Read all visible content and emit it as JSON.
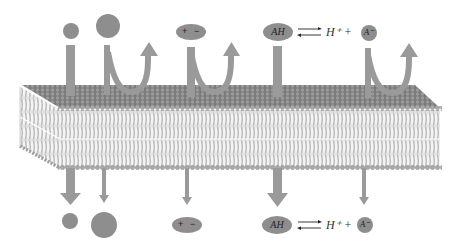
{
  "figure": {
    "colors": {
      "background": "#ffffff",
      "molecule": "#8c8c8c",
      "arrow": "#9a9a9a",
      "membrane_head": "#8a8a8a",
      "membrane_tail": "#b0b0b0",
      "text": "#333333"
    }
  },
  "top_row": {
    "small_molecule": {
      "label": ""
    },
    "large_molecule": {
      "label": ""
    },
    "charged_molecule": {
      "plus": "+",
      "minus": "−"
    },
    "weak_acid": {
      "oval": "AH",
      "equilibrium": "⇄",
      "proton": "H⁺ +",
      "anion": "A⁻"
    }
  },
  "bottom_row": {
    "small_molecule": {
      "label": ""
    },
    "large_molecule": {
      "label": ""
    },
    "charged_molecule": {
      "plus": "+",
      "minus": "−"
    },
    "weak_acid": {
      "oval": "AH",
      "equilibrium": "⇄",
      "proton": "H⁺ +",
      "anion": "A⁻"
    }
  }
}
